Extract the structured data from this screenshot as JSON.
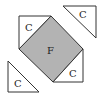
{
  "diagram": {
    "colors": {
      "stroke": "#333333",
      "fill_square": "#b3b3b3",
      "fill_triangle": "#ffffff"
    },
    "center_square": {
      "label": "F",
      "points": "51,16 83,49 53,82 19,49"
    },
    "triangles": [
      {
        "label": "C",
        "position": "upper-left",
        "points": "19,16 51,16 19,49",
        "label_x": 28,
        "label_y": 31
      },
      {
        "label": "C",
        "position": "lower-right",
        "points": "83,49 83,82 53,82",
        "label_x": 72,
        "label_y": 76
      },
      {
        "label": "C",
        "position": "top-right",
        "points": "63,6 96,6 96,38",
        "label_x": 82,
        "label_y": 18
      },
      {
        "label": "C",
        "position": "bottom-left",
        "points": "8,61 8,92 39,92",
        "label_x": 16,
        "label_y": 86
      }
    ]
  }
}
